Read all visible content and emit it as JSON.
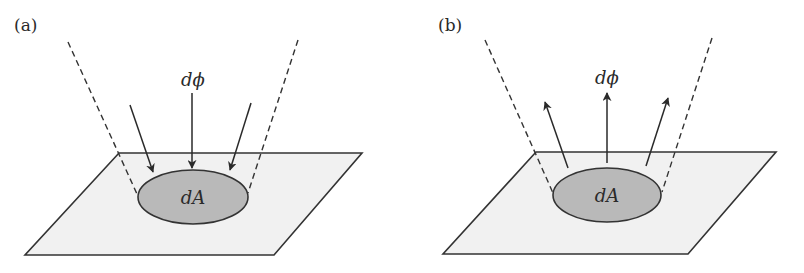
{
  "figure": {
    "panels": [
      {
        "id": "a",
        "label": "(a)",
        "flux_label": "dϕ",
        "area_label": "dA",
        "arrow_direction": "incoming"
      },
      {
        "id": "b",
        "label": "(b)",
        "flux_label": "dϕ",
        "area_label": "dA",
        "arrow_direction": "outgoing"
      }
    ],
    "colors": {
      "plane_fill": "#f1f1f1",
      "patch_fill": "#b9b9b9",
      "stroke": "#333333"
    }
  }
}
